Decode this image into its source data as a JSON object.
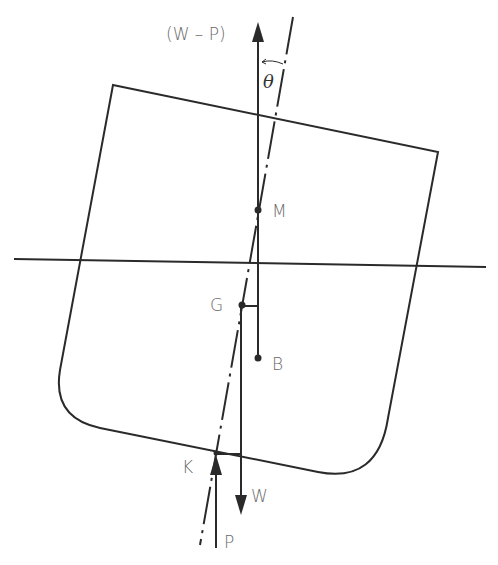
{
  "diagram": {
    "type": "ship-stability-heel",
    "labels": {
      "upward_force": "(W – P)",
      "angle": "θ",
      "metacentre": "M",
      "centre_of_gravity": "G",
      "centre_of_buoyancy": "B",
      "keel": "K",
      "weight": "W",
      "upthrust": "P"
    },
    "colors": {
      "line": "#2a2a2a",
      "label": "#6a6a6a"
    }
  }
}
